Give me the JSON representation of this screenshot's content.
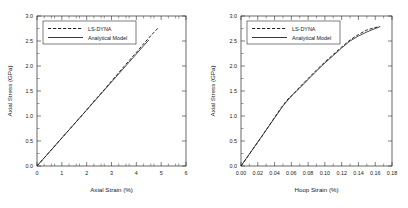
{
  "figure": {
    "background_color": "#ffffff",
    "line_color": "#222222",
    "panels": 2
  },
  "chart_data": [
    {
      "type": "line",
      "id": "axial-stress-vs-axial-strain",
      "title": "",
      "xlabel": "Axial Strain (%)",
      "ylabel": "Axial Stress (GPa)",
      "xlim": [
        0,
        6
      ],
      "ylim": [
        0,
        3.0
      ],
      "xticks": [
        0,
        1,
        2,
        3,
        4,
        5,
        6
      ],
      "xticklabels": [
        "0",
        "1",
        "2",
        "3",
        "4",
        "5",
        "6"
      ],
      "yticks": [
        0.0,
        0.5,
        1.0,
        1.5,
        2.0,
        2.5,
        3.0
      ],
      "yticklabels": [
        "0.0",
        "0.5",
        "1.0",
        "1.5",
        "2.0",
        "2.5",
        "3.0"
      ],
      "grid": false,
      "legend_position": "upper left",
      "series": [
        {
          "name": "LS-DYNA",
          "style": "dashed",
          "x": [
            0.0,
            0.25,
            0.5,
            0.75,
            1.0,
            1.25,
            1.5,
            1.75,
            2.0,
            2.25,
            2.5,
            2.75,
            3.0,
            3.25,
            3.5,
            3.75,
            4.0,
            4.25,
            4.5,
            4.7,
            4.9
          ],
          "y": [
            0.0,
            0.14,
            0.28,
            0.42,
            0.56,
            0.7,
            0.84,
            0.98,
            1.12,
            1.27,
            1.41,
            1.55,
            1.7,
            1.84,
            1.99,
            2.13,
            2.27,
            2.42,
            2.56,
            2.67,
            2.77
          ]
        },
        {
          "name": "Analytical Model",
          "style": "solid",
          "x": [
            0.0,
            0.5,
            1.0,
            1.5,
            2.0,
            2.5,
            3.0,
            3.5,
            4.0,
            4.25,
            4.5
          ],
          "y": [
            0.0,
            0.28,
            0.56,
            0.84,
            1.12,
            1.4,
            1.68,
            1.96,
            2.24,
            2.38,
            2.52
          ]
        }
      ]
    },
    {
      "type": "line",
      "id": "axial-stress-vs-hoop-strain",
      "title": "",
      "xlabel": "Hoop Strain (%)",
      "ylabel": "Axial Stress (GPa)",
      "xlim": [
        0.0,
        0.18
      ],
      "ylim": [
        0,
        3.0
      ],
      "xticks": [
        0.0,
        0.02,
        0.04,
        0.06,
        0.08,
        0.1,
        0.12,
        0.14,
        0.16,
        0.18
      ],
      "xticklabels": [
        "0.00",
        "0.02",
        "0.04",
        "0.06",
        "0.08",
        "0.10",
        "0.12",
        "0.14",
        "0.16",
        "0.18"
      ],
      "yticks": [
        0.0,
        0.5,
        1.0,
        1.5,
        2.0,
        2.5,
        3.0
      ],
      "yticklabels": [
        "0.0",
        "0.5",
        "1.0",
        "1.5",
        "2.0",
        "2.5",
        "3.0"
      ],
      "grid": false,
      "legend_position": "upper left",
      "series": [
        {
          "name": "LS-DYNA",
          "style": "dashed",
          "x": [
            0.0,
            0.008,
            0.016,
            0.024,
            0.032,
            0.04,
            0.048,
            0.056,
            0.062,
            0.07,
            0.08,
            0.09,
            0.1,
            0.11,
            0.12,
            0.13,
            0.14,
            0.15,
            0.158,
            0.166
          ],
          "y": [
            0.0,
            0.19,
            0.38,
            0.57,
            0.77,
            0.97,
            1.17,
            1.34,
            1.43,
            1.58,
            1.75,
            1.92,
            2.08,
            2.23,
            2.38,
            2.52,
            2.63,
            2.72,
            2.76,
            2.79
          ]
        },
        {
          "name": "Analytical Model",
          "style": "solid",
          "x": [
            0.0,
            0.01,
            0.02,
            0.03,
            0.04,
            0.05,
            0.06,
            0.07,
            0.08,
            0.09,
            0.1,
            0.11,
            0.12,
            0.13,
            0.14,
            0.15,
            0.16,
            0.165
          ],
          "y": [
            0.0,
            0.24,
            0.48,
            0.72,
            0.96,
            1.2,
            1.4,
            1.56,
            1.73,
            1.9,
            2.06,
            2.21,
            2.36,
            2.5,
            2.6,
            2.68,
            2.75,
            2.78
          ]
        }
      ]
    }
  ],
  "legend": {
    "entries": [
      {
        "label": "LS-DYNA",
        "style": "dashed"
      },
      {
        "label": "Analytical Model",
        "style": "solid"
      }
    ]
  }
}
